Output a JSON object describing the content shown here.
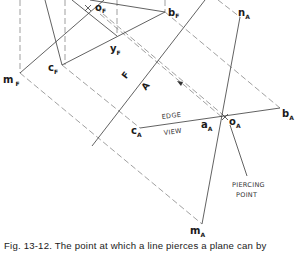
{
  "figure": {
    "caption": "Fig. 13-12. The point at which a line pierces a plane can by",
    "labels": {
      "o_F": {
        "main": "o",
        "sub": "F"
      },
      "b_F": {
        "main": "b",
        "sub": "F"
      },
      "y_F": {
        "main": "y",
        "sub": "F"
      },
      "c_F": {
        "main": "c",
        "sub": "F"
      },
      "m_F": {
        "main": "m",
        "sub": "F"
      },
      "n_A": {
        "main": "n",
        "sub": "A"
      },
      "b_A": {
        "main": "b",
        "sub": "A"
      },
      "a_A": {
        "main": "a",
        "sub": "A"
      },
      "o_A": {
        "main": "o",
        "sub": "A"
      },
      "c_A": {
        "main": "c",
        "sub": "A"
      },
      "m_A": {
        "main": "m",
        "sub": "A"
      }
    },
    "fold_line": {
      "upper": "F",
      "lower": "A"
    },
    "annotations": {
      "edge": "EDGE",
      "view": "VIEW",
      "piercing_1": "PIERCING",
      "piercing_2": "POINT"
    },
    "colors": {
      "line": "#3a3a3a",
      "dashed": "#6a6a6a",
      "text": "#1a1a1a"
    }
  }
}
